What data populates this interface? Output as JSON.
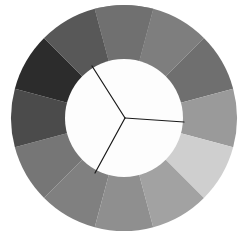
{
  "figure": {
    "type": "color-wheel-diagram",
    "background_color": "#ffffff",
    "width": 251,
    "height": 238
  },
  "wheel": {
    "center_x": 124,
    "center_y": 118,
    "outer_radius": 113,
    "inner_radius": 59,
    "segment_count": 12,
    "segment_angle_deg": 30,
    "start_angle_deg": -105,
    "inner_disc_color": "#fdfdfd",
    "segments": [
      {
        "index": 0,
        "label": "segment-1",
        "color": "#8c8c8c",
        "angle_start_deg": -105,
        "angle_end_deg": -75
      },
      {
        "index": 1,
        "label": "segment-2",
        "color": "#7e7e7e",
        "angle_start_deg": -75,
        "angle_end_deg": -45
      },
      {
        "index": 2,
        "label": "segment-3",
        "color": "#6f6f6f",
        "angle_start_deg": -45,
        "angle_end_deg": -15
      },
      {
        "index": 3,
        "label": "segment-4",
        "color": "#9a9a9a",
        "angle_start_deg": -15,
        "angle_end_deg": 15
      },
      {
        "index": 4,
        "label": "segment-5",
        "color": "#cfcfcf",
        "angle_start_deg": 15,
        "angle_end_deg": 45
      },
      {
        "index": 5,
        "label": "segment-6",
        "color": "#a2a2a2",
        "angle_start_deg": 45,
        "angle_end_deg": 75
      },
      {
        "index": 6,
        "label": "segment-7",
        "color": "#8f8f8f",
        "angle_start_deg": 75,
        "angle_end_deg": 105
      },
      {
        "index": 7,
        "label": "segment-8",
        "color": "#808080",
        "angle_start_deg": 105,
        "angle_end_deg": 135
      },
      {
        "index": 8,
        "label": "segment-9",
        "color": "#767676",
        "angle_start_deg": 135,
        "angle_end_deg": 165
      },
      {
        "index": 9,
        "label": "segment-10",
        "color": "#4b4b4b",
        "angle_start_deg": 165,
        "angle_end_deg": 195
      },
      {
        "index": 10,
        "label": "segment-11",
        "color": "#2c2c2c",
        "angle_start_deg": 195,
        "angle_end_deg": 225
      },
      {
        "index": 11,
        "label": "segment-12",
        "color": "#585858",
        "angle_start_deg": 225,
        "angle_end_deg": 255
      },
      {
        "index": 12,
        "label": "segment-13",
        "color": "#707070",
        "angle_start_deg": 255,
        "angle_end_deg": 285
      }
    ]
  },
  "divider": {
    "label": "y-divider",
    "stroke_color": "#1a1a1a",
    "stroke_width": 1.2,
    "hub_x": 125,
    "hub_y": 118,
    "spokes": [
      {
        "label": "spoke-upper-left",
        "end_x": 92,
        "end_y": 66
      },
      {
        "label": "spoke-lower-left",
        "end_x": 95,
        "end_y": 173
      },
      {
        "label": "spoke-right",
        "end_x": 184,
        "end_y": 122
      }
    ]
  },
  "chart_data": {
    "type": "pie",
    "categories": [
      "segment-1",
      "segment-2",
      "segment-3",
      "segment-4",
      "segment-5",
      "segment-6",
      "segment-7",
      "segment-8",
      "segment-9",
      "segment-10",
      "segment-11",
      "segment-12"
    ],
    "values": [
      30,
      30,
      30,
      30,
      30,
      30,
      30,
      30,
      30,
      30,
      30,
      30
    ],
    "colors": [
      "#8c8c8c",
      "#6f6f6f",
      "#9a9a9a",
      "#cfcfcf",
      "#a2a2a2",
      "#8f8f8f",
      "#808080",
      "#767676",
      "#4b4b4b",
      "#2c2c2c",
      "#585858",
      "#707070"
    ],
    "xlabel": "",
    "ylabel": "",
    "legend": "none",
    "grid": false
  }
}
